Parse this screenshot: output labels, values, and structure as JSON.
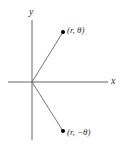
{
  "diagram": {
    "title": "",
    "axes": {
      "x_label": "x",
      "y_label": "y",
      "origin": [
        32,
        82
      ],
      "x_axis_extent": [
        8,
        108
      ],
      "y_axis_extent": [
        20,
        140
      ],
      "color": "#555555"
    },
    "points": [
      {
        "id": "point-r-theta",
        "label": "(r, θ)",
        "position": [
          63,
          32
        ],
        "color": "#000000"
      },
      {
        "id": "point-r-neg-theta",
        "label": "(r, −θ)",
        "position": [
          63,
          131
        ],
        "color": "#000000"
      }
    ],
    "segments": [
      {
        "from": [
          32,
          82
        ],
        "to": [
          63,
          32
        ],
        "color": "#666666"
      },
      {
        "from": [
          32,
          82
        ],
        "to": [
          63,
          131
        ],
        "color": "#666666"
      }
    ]
  }
}
